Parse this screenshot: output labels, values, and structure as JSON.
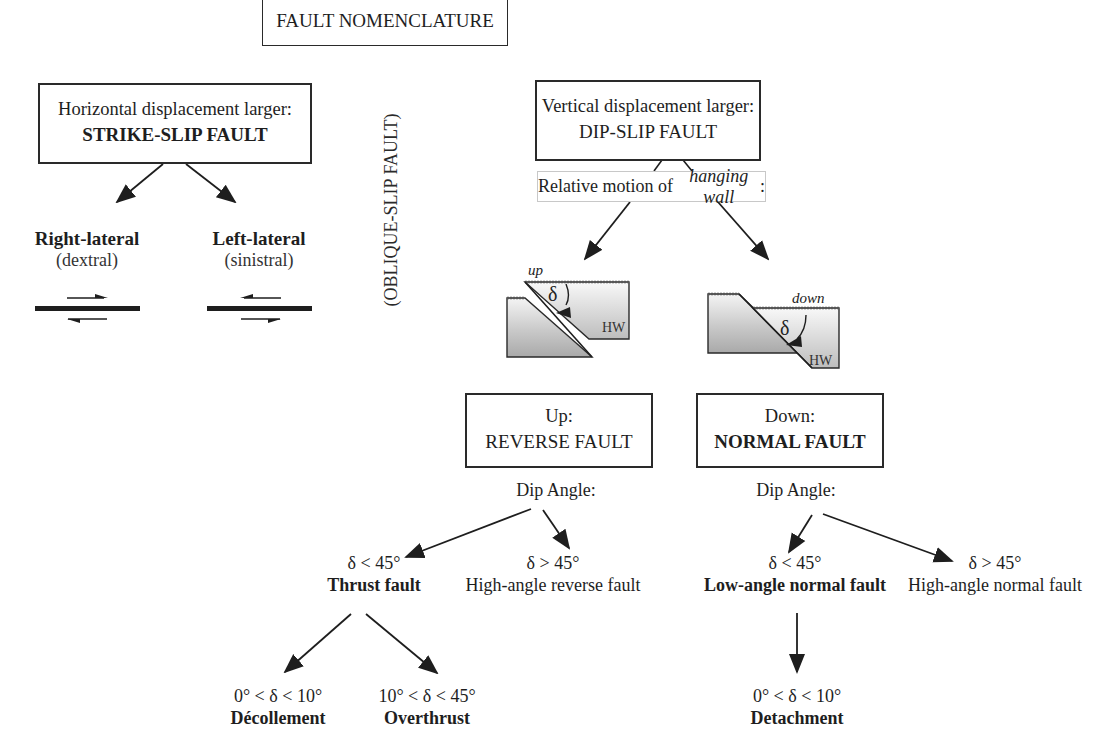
{
  "title": "FAULT NOMENCLATURE",
  "strike_slip": {
    "condition": "Horizontal displacement larger:",
    "name": "STRIKE-SLIP FAULT",
    "children": [
      {
        "name": "Right-lateral",
        "alt": "(dextral)",
        "sense": "right"
      },
      {
        "name": "Left-lateral",
        "alt": "(sinistral)",
        "sense": "left"
      }
    ]
  },
  "oblique": "(OBLIQUE-SLIP FAULT)",
  "dip_slip": {
    "condition": "Vertical displacement larger:",
    "name": "DIP-SLIP FAULT",
    "motion_label_prefix": "Relative motion of ",
    "motion_label_italic": "hanging wall",
    "motion_label_suffix": ":",
    "block_reverse": {
      "motion": "up",
      "angle": "δ",
      "wall": "HW"
    },
    "block_normal": {
      "motion": "down",
      "angle": "δ",
      "wall": "HW"
    }
  },
  "reverse": {
    "condition": "Up:",
    "name": "REVERSE FAULT",
    "dip_label": "Dip Angle:",
    "children": [
      {
        "range": "δ < 45°",
        "name": "Thrust fault",
        "bold": true
      },
      {
        "range": "δ > 45°",
        "name": "High-angle reverse fault",
        "bold": false
      }
    ],
    "thrust_children": [
      {
        "range": "0° < δ < 10°",
        "name": "Décollement"
      },
      {
        "range": "10° < δ < 45°",
        "name": "Overthrust"
      }
    ]
  },
  "normal": {
    "condition": "Down:",
    "name": "NORMAL FAULT",
    "dip_label": "Dip Angle:",
    "children": [
      {
        "range": "δ < 45°",
        "name": "Low-angle normal fault",
        "bold": true
      },
      {
        "range": "δ > 45°",
        "name": "High-angle normal fault",
        "bold": false
      }
    ],
    "low_angle_children": [
      {
        "range": "0° < δ < 10°",
        "name": "Detachment"
      }
    ]
  },
  "colors": {
    "line": "#1e1e1e",
    "box_border": "#2a2a2a",
    "light_border": "#c8c8c8",
    "block_light": "#f2f2f2",
    "block_dark": "#a8a8a8"
  }
}
